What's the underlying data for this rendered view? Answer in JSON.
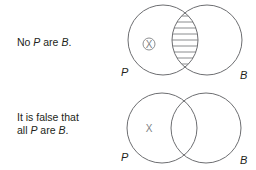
{
  "rows": [
    {
      "statement": {
        "parts": [
          "No ",
          "P",
          " are ",
          "B",
          "."
        ]
      },
      "diagram": {
        "left_label": "P",
        "right_label": "B",
        "left_circle": {
          "cx": 163,
          "cy": 40,
          "r": 35
        },
        "right_circle": {
          "cx": 207,
          "cy": 40,
          "r": 35
        },
        "intersection_shaded": true,
        "shading_style": "horizontal-hatch",
        "mark": {
          "symbol": "X",
          "circled": true,
          "region": "P only"
        }
      }
    },
    {
      "statement": {
        "line1": "It is false that",
        "line2_parts": [
          "all ",
          "P",
          " are ",
          "B",
          "."
        ]
      },
      "diagram": {
        "left_label": "P",
        "right_label": "B",
        "left_circle": {
          "cx": 162,
          "cy": 128,
          "r": 35
        },
        "right_circle": {
          "cx": 206,
          "cy": 128,
          "r": 35
        },
        "intersection_shaded": false,
        "mark": {
          "symbol": "X",
          "circled": false,
          "region": "P only"
        }
      }
    }
  ],
  "colors": {
    "stroke": "#6d6e71",
    "text": "#231f20",
    "mark": "#808285"
  }
}
